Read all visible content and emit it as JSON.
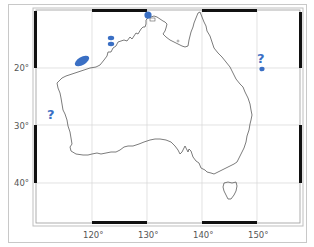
{
  "map": {
    "region": "Australia",
    "projection_bounds": {
      "lon_min": 109.8,
      "lon_max": 157.8,
      "lat_min": -46.7,
      "lat_max": -9.9
    },
    "x_ticks": [
      {
        "label": "120°",
        "lon": 120
      },
      {
        "label": "130°",
        "lon": 130
      },
      {
        "label": "140°",
        "lon": 140
      },
      {
        "label": "150°",
        "lon": 150
      }
    ],
    "y_ticks": [
      {
        "label": "20°",
        "lat": -20
      },
      {
        "label": "30°",
        "lat": -30
      },
      {
        "label": "40°",
        "lat": -40
      }
    ],
    "gridlines": true,
    "colors": {
      "marker": "#3a6fc4",
      "coastline": "#555555",
      "grid": "#d0d0d0",
      "frame_dark": "#111111"
    },
    "markers": [
      {
        "name": "north-west-shelf-ellipse",
        "shape": "ellipse",
        "lon": 117.5,
        "lat": -18.5
      },
      {
        "name": "kimberley-dot-upper",
        "shape": "ellipse",
        "lon": 124.5,
        "lat": -13.3
      },
      {
        "name": "kimberley-dot-lower",
        "shape": "ellipse",
        "lon": 124.5,
        "lat": -15.0
      },
      {
        "name": "darwin-north-dot",
        "shape": "circle",
        "lon": 130.3,
        "lat": -10.5
      },
      {
        "name": "east-coast-dot",
        "shape": "circle",
        "lon": 152.2,
        "lat": -20.0
      }
    ],
    "annotations": [
      {
        "name": "west-coast-question",
        "text": "?",
        "lon": 112.3,
        "lat": -27.0
      },
      {
        "name": "east-coast-question",
        "text": "?",
        "lon": 151.8,
        "lat": -17.5
      }
    ]
  }
}
